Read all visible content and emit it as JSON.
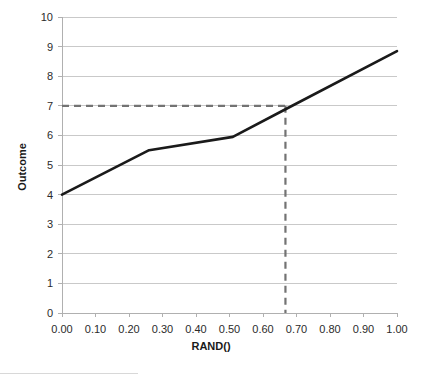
{
  "chart_data": {
    "type": "line",
    "title": "",
    "subtitle": "",
    "xlabel": "RAND()",
    "ylabel": "Outcome",
    "xlim": [
      0.0,
      1.0
    ],
    "ylim": [
      0,
      10
    ],
    "grid": "horizontal",
    "legend": "none",
    "x_ticks": [
      "0.00",
      "0.10",
      "0.20",
      "0.30",
      "0.40",
      "0.50",
      "0.60",
      "0.70",
      "0.80",
      "0.90",
      "1.00"
    ],
    "x_tick_values": [
      0.0,
      0.1,
      0.2,
      0.3,
      0.4,
      0.5,
      0.6,
      0.7,
      0.8,
      0.9,
      1.0
    ],
    "y_ticks": [
      "0",
      "1",
      "2",
      "3",
      "4",
      "5",
      "6",
      "7",
      "8",
      "9",
      "10"
    ],
    "y_tick_values": [
      0,
      1,
      2,
      3,
      4,
      5,
      6,
      7,
      8,
      9,
      10
    ],
    "series": [
      {
        "name": "Inverse cumulative distribution",
        "style": "solid",
        "color": "#1a1a1a",
        "x": [
          0.0,
          0.26,
          0.51,
          0.67,
          1.0
        ],
        "values": [
          4.0,
          5.5,
          5.95,
          6.9,
          8.85
        ]
      }
    ],
    "reference_lines": [
      {
        "name": "outcome-reference",
        "orientation": "horizontal",
        "value": 7,
        "from_x": 0.0,
        "to_x": 0.667,
        "style": "dashed",
        "color": "#737373"
      },
      {
        "name": "rand-reference",
        "orientation": "vertical",
        "value": 0.667,
        "from_y": 0,
        "to_y": 7,
        "style": "dashed",
        "color": "#737373"
      }
    ],
    "annotations": []
  },
  "axes": {
    "x_title": "RAND()",
    "y_title": "Outcome"
  },
  "colors": {
    "data_line": "#1a1a1a",
    "reference_line": "#737373",
    "gridline": "#c9c9c9",
    "axis": "#b0b0b0",
    "background": "#ffffff",
    "text": "#2b2b2b"
  }
}
